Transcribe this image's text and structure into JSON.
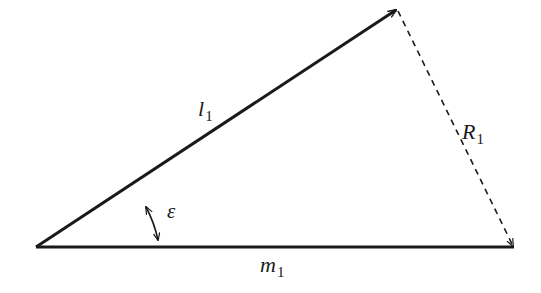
{
  "diagram": {
    "type": "vector-triangle",
    "colors": {
      "stroke": "#1a1a1a",
      "background": "#ffffff"
    },
    "vertices": {
      "origin": [
        36,
        247
      ],
      "apex": [
        397,
        9
      ],
      "right": [
        514,
        248
      ]
    },
    "edges": [
      {
        "name": "l1",
        "from": "origin",
        "to": "apex",
        "style": "solid",
        "arrow_at": "apex"
      },
      {
        "name": "m1",
        "from": "origin",
        "to": "right",
        "style": "solid",
        "arrow_at": "none"
      },
      {
        "name": "R1",
        "from": "apex",
        "to": "right",
        "style": "dashed",
        "arrow_at": "right"
      }
    ],
    "angle": {
      "name": "epsilon",
      "between": [
        "l1",
        "m1"
      ],
      "arrows": "both-ends"
    }
  },
  "labels": {
    "l1": {
      "base": "l",
      "sub": "1"
    },
    "m1": {
      "base": "m",
      "sub": "1"
    },
    "R1": {
      "base": "R",
      "sub": "1"
    },
    "epsilon": {
      "base": "ε"
    }
  }
}
